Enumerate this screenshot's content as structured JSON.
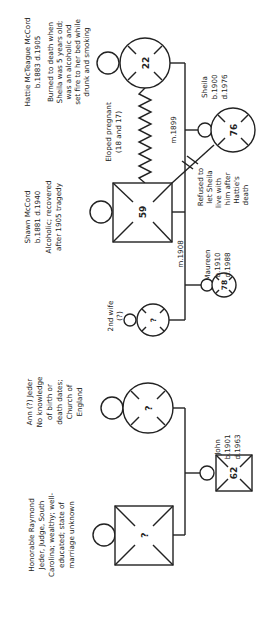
{
  "diagram": {
    "type": "genogram",
    "orientation": "rotated-90-ccw",
    "people": {
      "hattie": {
        "symbol": "female-deceased",
        "age": "22",
        "label_lines": [
          "Hattie McTeague McCord",
          "b.1883  d.1905",
          "Burned to death when",
          "Sheila was 5 years old;",
          "was an alcoholic and",
          "set fire to her bed while",
          "drunk and smoking"
        ]
      },
      "shawn": {
        "symbol": "male-deceased",
        "age": "59",
        "label_lines": [
          "Shawn McCord",
          "b.1881  d.1940",
          "Alcoholic; recovered",
          "after 1905 tragedy"
        ]
      },
      "sheila": {
        "symbol": "female-deceased",
        "age": "76",
        "label_lines": [
          "Sheila",
          "b.1900",
          "d.1976"
        ]
      },
      "maureen": {
        "symbol": "female-deceased",
        "age": "78",
        "label_lines": [
          "Maureen",
          "b.1910",
          "d.1988"
        ]
      },
      "second_wife": {
        "symbol": "female-deceased",
        "age": "?",
        "label_lines": [
          "2nd wife",
          "(?)"
        ]
      },
      "ann": {
        "symbol": "female-deceased",
        "age": "?",
        "label_lines": [
          "Ann (?) Jeder",
          "No knowledge",
          "of birth or",
          "death dates;",
          "Church of",
          "England"
        ]
      },
      "john": {
        "symbol": "male-deceased",
        "age": "62",
        "label_lines": [
          "John",
          "b.1901",
          "d.1963"
        ]
      },
      "judge": {
        "symbol": "male-deceased",
        "age": "?",
        "label_lines": [
          "Honorable Raymond",
          "Jeder, Judge, South",
          "Carolina; wealthy; well-",
          "educated; state of",
          "marriage unknown"
        ]
      }
    },
    "relationships": {
      "eloped": [
        "Eloped pregnant",
        "(18 and 17)"
      ],
      "marriage_1899": "m.1899",
      "marriage_1908": "m.1908",
      "cutoff": [
        "Refused to",
        "let Sheila",
        "live with",
        "him after",
        "Hattie's",
        "death"
      ]
    }
  }
}
